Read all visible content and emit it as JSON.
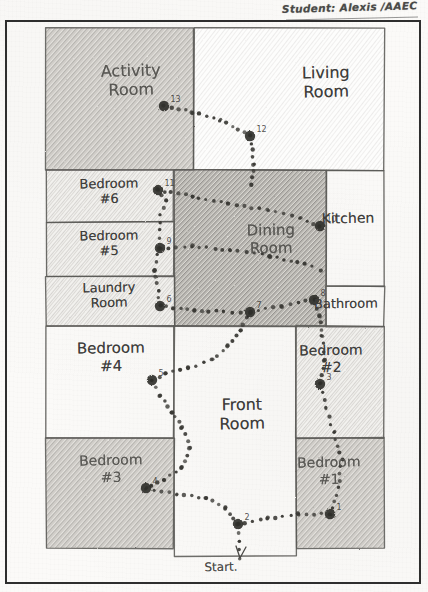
{
  "document": {
    "title": "Hand-drawn floor plan worksheet",
    "header_text": "Student: Alexis  /AAEC",
    "start_label": "Start."
  },
  "plan": {
    "rooms": [
      {
        "name": "activity-room",
        "label": "Activity\nRoom",
        "x": 4,
        "y": 4,
        "w": 148,
        "h": 142,
        "shade": "dark",
        "lx": 22,
        "ly": 38,
        "fs": 16,
        "rot": -1.5
      },
      {
        "name": "living-room",
        "label": "Living\nRoom",
        "x": 152,
        "y": 4,
        "w": 190,
        "h": 142,
        "shade": "light",
        "lx": 196,
        "ly": 40,
        "fs": 16,
        "rot": -1.0
      },
      {
        "name": "bedroom-6",
        "label": "Bedroom\n#6",
        "x": 4,
        "y": 146,
        "w": 128,
        "h": 52,
        "shade": "mid",
        "lx": 10,
        "ly": 152,
        "fs": 13,
        "rot": -1.2
      },
      {
        "name": "bedroom-5",
        "label": "Bedroom\n#5",
        "x": 4,
        "y": 198,
        "w": 128,
        "h": 54,
        "shade": "mid",
        "lx": 10,
        "ly": 204,
        "fs": 13,
        "rot": -1.0
      },
      {
        "name": "laundry-room",
        "label": "Laundry\nRoom",
        "x": 4,
        "y": 252,
        "w": 128,
        "h": 50,
        "shade": "mid",
        "lx": 10,
        "ly": 256,
        "fs": 13,
        "rot": -1.3
      },
      {
        "name": "dining-room",
        "label": "Dining\nRoom",
        "x": 132,
        "y": 146,
        "w": 152,
        "h": 156,
        "shade": "darker",
        "lx": 160,
        "ly": 198,
        "fs": 15,
        "rot": -1.0
      },
      {
        "name": "kitchen",
        "label": "Kitchen",
        "x": 284,
        "y": 146,
        "w": 58,
        "h": 116,
        "shade": "white",
        "lx": 278,
        "ly": 186,
        "fs": 14,
        "rot": -1.0
      },
      {
        "name": "bathroom",
        "label": "Bathroom",
        "x": 284,
        "y": 262,
        "w": 58,
        "h": 40,
        "shade": "white",
        "lx": 272,
        "ly": 272,
        "fs": 13,
        "rot": -0.8
      },
      {
        "name": "bedroom-4",
        "label": "Bedroom\n#4",
        "x": 4,
        "y": 302,
        "w": 128,
        "h": 112,
        "shade": "white",
        "lx": 12,
        "ly": 316,
        "fs": 15,
        "rot": -1.0
      },
      {
        "name": "front-room",
        "label": "Front\nRoom",
        "x": 132,
        "y": 302,
        "w": 122,
        "h": 230,
        "shade": "white",
        "lx": 146,
        "ly": 372,
        "fs": 16,
        "rot": -1.0
      },
      {
        "name": "bedroom-2",
        "label": "Bedroom\n#2",
        "x": 254,
        "y": 302,
        "w": 88,
        "h": 112,
        "shade": "mid",
        "lx": 252,
        "ly": 318,
        "fs": 14,
        "rot": -1.0
      },
      {
        "name": "bedroom-3",
        "label": "Bedroom\n#3",
        "x": 4,
        "y": 414,
        "w": 128,
        "h": 110,
        "shade": "dark",
        "lx": 12,
        "ly": 428,
        "fs": 14,
        "rot": -1.5
      },
      {
        "name": "bedroom-1",
        "label": "Bedroom\n#1",
        "x": 254,
        "y": 414,
        "w": 88,
        "h": 110,
        "shade": "dark",
        "lx": 250,
        "ly": 430,
        "fs": 14,
        "rot": -1.2
      }
    ],
    "waypoints": [
      {
        "id": 1,
        "label": "1",
        "x": 288,
        "y": 490
      },
      {
        "id": 2,
        "label": "2",
        "x": 196,
        "y": 500
      },
      {
        "id": 3,
        "label": "3",
        "x": 278,
        "y": 360
      },
      {
        "id": 4,
        "label": "4",
        "x": 104,
        "y": 464
      },
      {
        "id": 5,
        "label": "5",
        "x": 110,
        "y": 356
      },
      {
        "id": 6,
        "label": "6",
        "x": 118,
        "y": 282
      },
      {
        "id": 7,
        "label": "7",
        "x": 208,
        "y": 288
      },
      {
        "id": 8,
        "label": "8",
        "x": 272,
        "y": 276
      },
      {
        "id": 9,
        "label": "9",
        "x": 118,
        "y": 224
      },
      {
        "id": 10,
        "label": "10",
        "x": 278,
        "y": 202
      },
      {
        "id": 11,
        "label": "11",
        "x": 116,
        "y": 166
      },
      {
        "id": 12,
        "label": "12",
        "x": 208,
        "y": 112
      },
      {
        "id": 13,
        "label": "13",
        "x": 122,
        "y": 82
      }
    ],
    "path_segments": [
      {
        "name": "activity-to-living",
        "points": "122,82 150,88 178,96 208,112"
      },
      {
        "name": "living-down",
        "points": "208,112 212,140 210,160"
      },
      {
        "name": "dining-upper-run",
        "points": "116,166 150,172 186,180 226,186 258,194 278,202"
      },
      {
        "name": "dining-mid-run",
        "points": "118,224 150,222 188,226 228,232 262,240 278,246"
      },
      {
        "name": "dining-lower-run",
        "points": "118,282 152,286 182,288 208,288 240,282 272,276"
      },
      {
        "name": "bed6-spur",
        "points": "116,166 124,176 118,190 118,206 118,224"
      },
      {
        "name": "laundry-spur",
        "points": "118,224 112,246 116,266 118,282"
      },
      {
        "name": "dining-to-front",
        "points": "208,288 198,306 186,322 170,336 146,344 124,350 110,356"
      },
      {
        "name": "bed4-to-front",
        "points": "110,356 118,372 130,388 140,404 148,424 140,444 122,456 104,464"
      },
      {
        "name": "front-bottom-run",
        "points": "104,464 134,470 164,474 184,484 196,500"
      },
      {
        "name": "front-right-run",
        "points": "196,500 226,494 256,490 288,490"
      },
      {
        "name": "bed1-up",
        "points": "288,490 296,464 300,436 292,408 284,384 278,360"
      },
      {
        "name": "bed2-to-dining",
        "points": "278,360 282,336 280,312 278,292 272,276"
      },
      {
        "name": "start-arrow",
        "points": "196,500 198,518 198,534"
      }
    ]
  }
}
